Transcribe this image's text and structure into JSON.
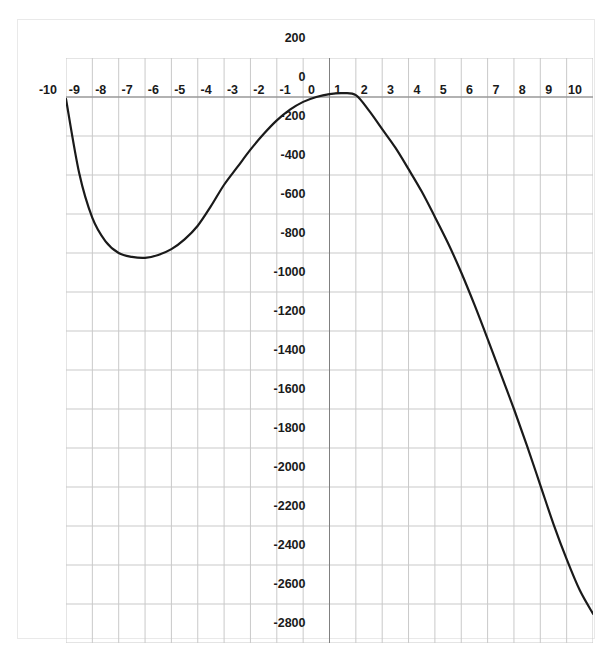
{
  "chart_data": {
    "type": "line",
    "title": "",
    "subtitle": "",
    "xlabel": "",
    "ylabel": "",
    "xlim": [
      -10,
      10
    ],
    "ylim": [
      -2800,
      200
    ],
    "grid": true,
    "legend": false,
    "legend_position": "none",
    "x_tick_labels": [
      "-10",
      "-9",
      "-8",
      "-7",
      "-6",
      "-5",
      "-4",
      "-3",
      "-2",
      "-1",
      "0",
      "1",
      "2",
      "3",
      "4",
      "5",
      "6",
      "7",
      "8",
      "9",
      "10"
    ],
    "x_ticks": [
      -10,
      -9,
      -8,
      -7,
      -6,
      -5,
      -4,
      -3,
      -2,
      -1,
      0,
      1,
      2,
      3,
      4,
      5,
      6,
      7,
      8,
      9,
      10
    ],
    "y_tick_labels": [
      "200",
      "0",
      "-200",
      "-400",
      "-600",
      "-800",
      "-1000",
      "-1200",
      "-1400",
      "-1600",
      "-1800",
      "-2000",
      "-2200",
      "-2400",
      "-2600",
      "-2800"
    ],
    "y_ticks": [
      200,
      0,
      -200,
      -400,
      -600,
      -800,
      -1000,
      -1200,
      -1400,
      -1600,
      -1800,
      -2000,
      -2200,
      -2400,
      -2600,
      -2800
    ],
    "x_tick_step": 1,
    "y_tick_step": 200,
    "series": [
      {
        "name": "curve",
        "color": "#1a1a1a",
        "line_width": 2.2,
        "marker": "none",
        "x": [
          -10,
          -9.5,
          -9,
          -8.5,
          -8,
          -7.5,
          -7,
          -6.5,
          -6,
          -5.5,
          -5,
          -4.5,
          -4,
          -3.5,
          -3,
          -2.5,
          -2,
          -1.5,
          -1,
          -0.5,
          0,
          0.5,
          1,
          1.5,
          2,
          2.5,
          3,
          3.5,
          4,
          4.5,
          5,
          5.5,
          6,
          6.5,
          7,
          7.5,
          8,
          8.5,
          9,
          9.5,
          10
        ],
        "y": [
          -10,
          -390,
          -620,
          -740,
          -800,
          -820,
          -825,
          -810,
          -780,
          -730,
          -660,
          -560,
          -450,
          -360,
          -270,
          -190,
          -120,
          -65,
          -25,
          0,
          15,
          20,
          10,
          -70,
          -165,
          -260,
          -370,
          -485,
          -615,
          -750,
          -900,
          -1065,
          -1240,
          -1420,
          -1600,
          -1790,
          -1990,
          -2190,
          -2370,
          -2530,
          -2650
        ]
      }
    ],
    "annotations": []
  },
  "style": {
    "grid_color": "#c9c9c9",
    "axis_color": "#808080",
    "frame_color": "#e9e9e9",
    "background": "#ffffff",
    "tick_label_color": "#1a1a1a"
  }
}
